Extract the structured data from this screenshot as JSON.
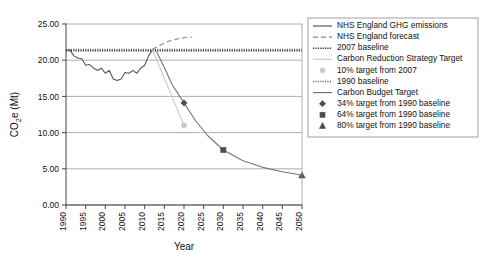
{
  "chart_data": {
    "type": "line",
    "title": "",
    "xlabel": "Year",
    "ylabel": "CO2e (Mt)",
    "ylabel_parts": {
      "pre": "CO",
      "sub": "2",
      "post": "e (Mt)"
    },
    "xlim": [
      1990,
      2050
    ],
    "ylim": [
      0.0,
      25.0
    ],
    "yticks": [
      "0.00",
      "5.00",
      "10.00",
      "15.00",
      "20.00",
      "25.00"
    ],
    "ytick_values": [
      0,
      5,
      10,
      15,
      20,
      25
    ],
    "xticks": [
      "1990",
      "1995",
      "2000",
      "2005",
      "2010",
      "2015",
      "2020",
      "2025",
      "2030",
      "2035",
      "2040",
      "2045",
      "2050"
    ],
    "xtick_values": [
      1990,
      1995,
      2000,
      2005,
      2010,
      2015,
      2020,
      2025,
      2030,
      2035,
      2040,
      2045,
      2050
    ],
    "grid": "horizontal",
    "legend_position": "right-outside",
    "series": [
      {
        "name": "NHS England GHG emissions",
        "style": "solid",
        "color": "#555555",
        "x": [
          1990,
          1991,
          1992,
          1993,
          1994,
          1995,
          1996,
          1997,
          1998,
          1999,
          2000,
          2001,
          2002,
          2003,
          2004,
          2005,
          2006,
          2007,
          2008,
          2009,
          2010,
          2011,
          2012
        ],
        "values": [
          21.4,
          21.4,
          20.6,
          20.3,
          20.2,
          19.3,
          19.4,
          18.9,
          18.6,
          18.9,
          18.2,
          18.6,
          17.4,
          17.2,
          17.4,
          18.3,
          18.2,
          18.6,
          18.2,
          18.9,
          19.3,
          20.6,
          21.4
        ]
      },
      {
        "name": "NHS England forecast",
        "style": "dashed",
        "color": "#8a8a8a",
        "x": [
          2012,
          2014,
          2016,
          2018,
          2020,
          2022
        ],
        "values": [
          21.5,
          22.1,
          22.6,
          22.9,
          23.1,
          23.2
        ]
      },
      {
        "name": "2007 baseline",
        "style": "dotted",
        "color": "#333333",
        "x": [
          1990,
          2050
        ],
        "values": [
          21.3,
          21.3
        ]
      },
      {
        "name": "Carbon Reduction Strategy Target",
        "style": "solid",
        "color": "#c9c9c9",
        "x": [
          2012,
          2020
        ],
        "values": [
          21.4,
          11.0
        ]
      },
      {
        "name": "1990 baseline",
        "style": "dotted",
        "color": "#6d6d6d",
        "x": [
          1990,
          2050
        ],
        "values": [
          21.5,
          21.5
        ]
      },
      {
        "name": "Carbon Budget Target",
        "style": "solid",
        "color": "#777777",
        "x": [
          2013,
          2015,
          2017,
          2020,
          2023,
          2026,
          2030,
          2035,
          2040,
          2045,
          2050
        ],
        "values": [
          21.2,
          19.0,
          16.6,
          14.1,
          11.6,
          9.6,
          7.6,
          6.1,
          5.2,
          4.6,
          4.1
        ]
      }
    ],
    "markers": [
      {
        "name": "10% target from 2007",
        "shape": "circle",
        "color": "#c9c9c9",
        "x": 2020,
        "y": 11.0
      },
      {
        "name": "34% target from 1990 baseline",
        "shape": "diamond",
        "color": "#4d4d4d",
        "x": 2020,
        "y": 14.1
      },
      {
        "name": "64% target from 1990 baseline",
        "shape": "square",
        "color": "#4d4d4d",
        "x": 2030,
        "y": 7.6
      },
      {
        "name": "80% target from 1990 baseline",
        "shape": "triangle",
        "color": "#4d4d4d",
        "x": 2050,
        "y": 4.1
      }
    ],
    "legend": [
      {
        "label": "NHS England GHG emissions",
        "kind": "line",
        "style": "solid",
        "color": "#555555"
      },
      {
        "label": "NHS England forecast",
        "kind": "line",
        "style": "dashed",
        "color": "#8a8a8a"
      },
      {
        "label": "2007 baseline",
        "kind": "line",
        "style": "dotted",
        "color": "#333333"
      },
      {
        "label": "Carbon Reduction Strategy Target",
        "kind": "line",
        "style": "solid",
        "color": "#c9c9c9"
      },
      {
        "label": "10% target from 2007",
        "kind": "marker",
        "shape": "circle",
        "color": "#c9c9c9"
      },
      {
        "label": "1990 baseline",
        "kind": "line",
        "style": "dotted",
        "color": "#6d6d6d"
      },
      {
        "label": "Carbon Budget Target",
        "kind": "line",
        "style": "solid",
        "color": "#777777"
      },
      {
        "label": "34% target from 1990 baseline",
        "kind": "marker",
        "shape": "diamond",
        "color": "#4d4d4d"
      },
      {
        "label": "64% target from 1990 baseline",
        "kind": "marker",
        "shape": "square",
        "color": "#4d4d4d"
      },
      {
        "label": "80% target from 1990 baseline",
        "kind": "marker",
        "shape": "triangle",
        "color": "#4d4d4d"
      }
    ]
  }
}
